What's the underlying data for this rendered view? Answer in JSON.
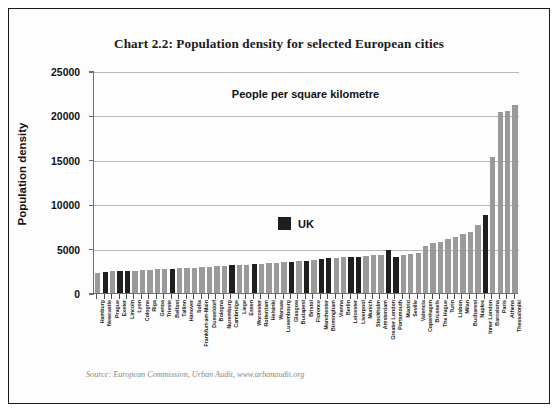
{
  "title": "Chart 2.2: Population density for selected European cities",
  "subtitle": "People per square kilometre",
  "source": "Source: European Commission, Urban Audit, www.urbanaudit.org",
  "legend": {
    "label": "UK",
    "swatch_color": "#1f1f1f"
  },
  "colors": {
    "bar_default": "#9a9a9a",
    "bar_uk": "#1f1f1f",
    "axis": "#6e6e6e",
    "gridline": "#b9b9b9",
    "text": "#111111",
    "source_text": "#8a8a8a"
  },
  "chart_data": {
    "type": "bar",
    "title": "Chart 2.2: Population density for selected European cities",
    "subtitle": "People per square kilometre",
    "xlabel": "",
    "ylabel": "Population density",
    "ylim": [
      0,
      25000
    ],
    "yticks": [
      0,
      5000,
      10000,
      15000,
      20000,
      25000
    ],
    "ytick_labels": [
      "0",
      "5000",
      "10000",
      "15000",
      "20000",
      "25000"
    ],
    "grid": true,
    "legend_position": "center",
    "series": [
      {
        "name": "UK",
        "color": "#1f1f1f"
      },
      {
        "name": "Other European cities",
        "color": "#9a9a9a"
      }
    ],
    "categories": [
      "Hamburg",
      "Newcastle",
      "Prague",
      "Exeter",
      "Lincoln",
      "Lyon",
      "Cologne",
      "Riga",
      "Genoa",
      "Trieste",
      "Belfast",
      "Tallinn",
      "Hanover",
      "Sofia",
      "Frankfurt-am-Main",
      "Dusseldorf",
      "Bologna",
      "Nuremburg",
      "Cambridge",
      "Liege",
      "Essen",
      "Worcester",
      "Rotterdam",
      "Helsinki",
      "Warsaw",
      "Luxembourg",
      "Glasgow",
      "Budapest",
      "Bristol",
      "Florence",
      "Manchester",
      "Birmingham",
      "Vienna",
      "Berlin",
      "Leicester",
      "Liverpool",
      "Munich",
      "Stockholm",
      "Amsterdam",
      "Greater London",
      "Portsmouth",
      "Madrid",
      "Seville",
      "Valencia",
      "Copenhagen",
      "Brussels",
      "The Hague",
      "Turin",
      "Lisbon",
      "Milan",
      "Bucharest",
      "Naples",
      "Inner London",
      "Barcelona",
      "Paris",
      "Athens",
      "Thessaloniki"
    ],
    "values": [
      2300,
      2400,
      2450,
      2450,
      2500,
      2500,
      2550,
      2600,
      2650,
      2700,
      2750,
      2800,
      2800,
      2850,
      2900,
      2950,
      3000,
      3050,
      3100,
      3150,
      3200,
      3250,
      3300,
      3350,
      3400,
      3450,
      3500,
      3550,
      3650,
      3700,
      3800,
      3900,
      3950,
      4000,
      4050,
      4100,
      4200,
      4250,
      4300,
      4800,
      4100,
      4250,
      4400,
      4500,
      5300,
      5600,
      5700,
      6100,
      6300,
      6700,
      6900,
      7700,
      8800,
      15300,
      20400,
      20500,
      21200
    ],
    "uk_cities": [
      "Newcastle",
      "Exeter",
      "Lincoln",
      "Belfast",
      "Cambridge",
      "Worcester",
      "Glasgow",
      "Bristol",
      "Manchester",
      "Birmingham",
      "Leicester",
      "Liverpool",
      "Greater London",
      "Portsmouth",
      "Inner London"
    ]
  }
}
